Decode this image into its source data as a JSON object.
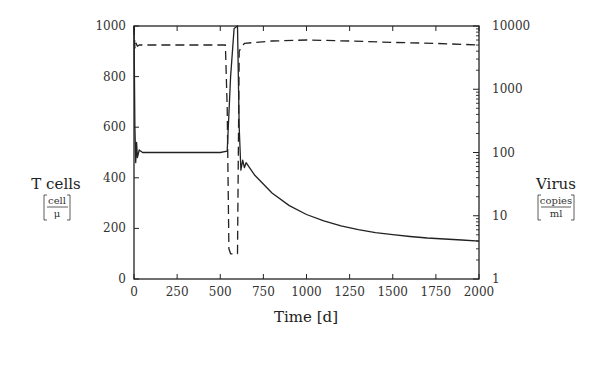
{
  "chart_data": {
    "type": "line",
    "title": "",
    "xlabel": "Time [d]",
    "ylabel_left": "T cells",
    "ylabel_left_unit_num": "cell",
    "ylabel_left_unit_den": "μ",
    "ylabel_right": "Virus",
    "ylabel_right_unit_num": "copies",
    "ylabel_right_unit_den": "ml",
    "xlim": [
      0,
      2000
    ],
    "ylim_left": [
      0,
      1000
    ],
    "ylim_right": [
      1,
      10000
    ],
    "yscale_right": "log",
    "grid": false,
    "legend": null,
    "x_ticks": [
      "0",
      "250",
      "500",
      "750",
      "1000",
      "1250",
      "1500",
      "1750",
      "2000"
    ],
    "y_left_ticks": [
      "0",
      "200",
      "400",
      "600",
      "800",
      "1000"
    ],
    "y_right_ticks": [
      "1",
      "10",
      "100",
      "1000",
      "10000"
    ],
    "series": [
      {
        "name": "T cells",
        "axis": "left",
        "style": "solid",
        "x": [
          0,
          5,
          10,
          15,
          20,
          30,
          50,
          100,
          250,
          500,
          540,
          560,
          580,
          600,
          610,
          620,
          630,
          640,
          650,
          700,
          800,
          900,
          1000,
          1100,
          1200,
          1300,
          1400,
          1500,
          1600,
          1700,
          1800,
          1900,
          2000
        ],
        "values": [
          1000,
          600,
          460,
          540,
          480,
          510,
          500,
          500,
          500,
          500,
          505,
          800,
          990,
          1000,
          600,
          430,
          470,
          440,
          460,
          410,
          340,
          290,
          255,
          230,
          210,
          195,
          183,
          175,
          168,
          162,
          158,
          154,
          150
        ]
      },
      {
        "name": "Virus",
        "axis": "right",
        "style": "dashed",
        "x": [
          0,
          5,
          10,
          20,
          30,
          100,
          250,
          500,
          530,
          540,
          550,
          560,
          580,
          590,
          600,
          610,
          620,
          640,
          700,
          800,
          1000,
          1250,
          1500,
          1750,
          2000
        ],
        "values": [
          10000,
          4500,
          5500,
          4800,
          5000,
          5000,
          5000,
          5000,
          5000,
          500,
          3,
          2.5,
          2.5,
          2.5,
          2.5,
          4000,
          4500,
          5300,
          5500,
          5800,
          6000,
          5800,
          5500,
          5300,
          5000
        ]
      }
    ]
  }
}
